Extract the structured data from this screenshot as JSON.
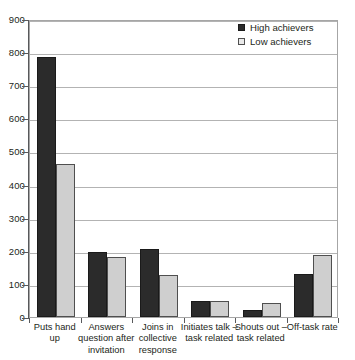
{
  "chart_data": {
    "type": "bar",
    "title": "",
    "xlabel": "",
    "ylabel": "",
    "ylim": [
      0,
      900
    ],
    "ytick_step": 100,
    "grid": true,
    "legend_position": "top-right",
    "categories": [
      "Puts hand up",
      "Answers question after invitation",
      "Joins in collective response",
      "Initiates talk – task related",
      "Shouts out – task related",
      "Off-task rate"
    ],
    "category_lines": [
      [
        "Puts hand",
        "up"
      ],
      [
        "Answers",
        "question after",
        "invitation"
      ],
      [
        "Joins in",
        "collective",
        "response"
      ],
      [
        "Initiates talk –",
        "task related"
      ],
      [
        "Shouts out –",
        "task related"
      ],
      [
        "Off-task rate"
      ]
    ],
    "yticks": [
      "0",
      "100",
      "200",
      "300",
      "400",
      "500",
      "600",
      "700",
      "800",
      "900"
    ],
    "series": [
      {
        "name": "High achievers",
        "color": "#2b2b2b",
        "values": [
          785,
          195,
          205,
          47,
          22,
          130
        ]
      },
      {
        "name": "Low achievers",
        "color": "#cfcfcf",
        "values": [
          463,
          180,
          128,
          47,
          42,
          188
        ]
      }
    ]
  },
  "legend": {
    "items": [
      {
        "label": "High achievers",
        "swatch": "high"
      },
      {
        "label": "Low achievers",
        "swatch": "low"
      }
    ]
  },
  "colors": {
    "high_achievers": "#2b2b2b",
    "low_achievers": "#cfcfcf",
    "gridline": "#b3b3b3",
    "axis": "#58595b",
    "text": "#231f20"
  }
}
